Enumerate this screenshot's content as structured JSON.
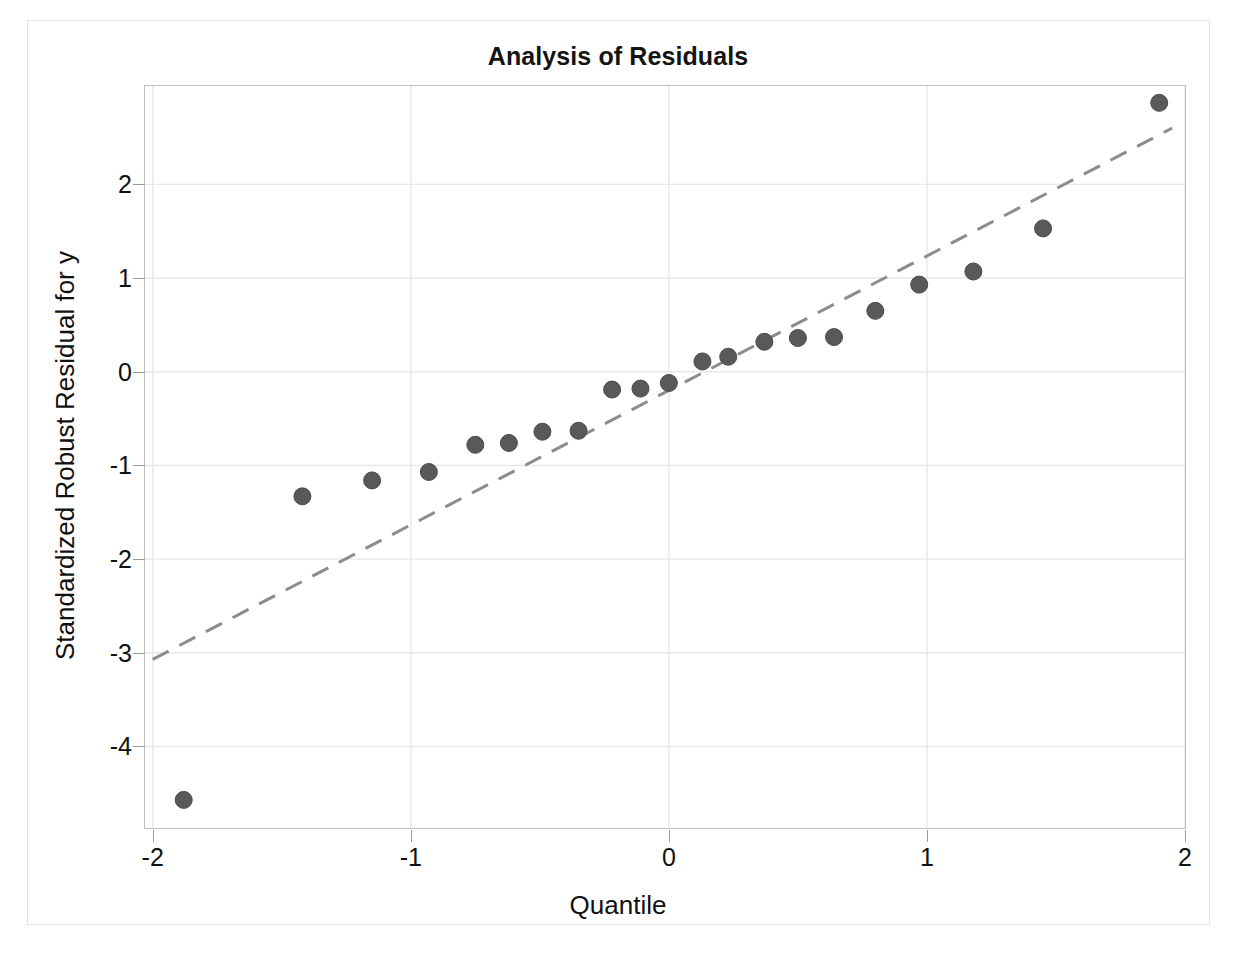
{
  "figure": {
    "title": "Analysis of Residuals",
    "background_color": "#ffffff",
    "frame_color": "#bfbfbf",
    "outer_border_color": "#e3e3e3"
  },
  "chart_data": {
    "type": "scatter",
    "title": "Analysis of Residuals",
    "xlabel": "Quantile",
    "ylabel": "Standardized Robust Residual for y",
    "xlim": [
      -2.03,
      2.0
    ],
    "ylim": [
      -4.87,
      3.05
    ],
    "xticks": [
      -2,
      -1,
      0,
      1,
      2
    ],
    "xtick_labels": [
      "-2",
      "-1",
      "0",
      "1",
      "2"
    ],
    "yticks": [
      2,
      1,
      0,
      -1,
      -2,
      -3,
      -4
    ],
    "ytick_labels": [
      "2",
      "1",
      "0",
      "-1",
      "-2",
      "-3",
      "-4"
    ],
    "grid": true,
    "grid_color": "#e8e8e8",
    "legend": null,
    "marker": {
      "shape": "circle",
      "fill_color": "#595959",
      "edge_color": "#4a4a4a",
      "size_px": 17
    },
    "series": [
      {
        "name": "Standardized robust residuals",
        "points": [
          {
            "x": -1.88,
            "y": -4.57
          },
          {
            "x": -1.42,
            "y": -1.33
          },
          {
            "x": -1.15,
            "y": -1.16
          },
          {
            "x": -0.93,
            "y": -1.07
          },
          {
            "x": -0.75,
            "y": -0.78
          },
          {
            "x": -0.62,
            "y": -0.76
          },
          {
            "x": -0.49,
            "y": -0.64
          },
          {
            "x": -0.35,
            "y": -0.63
          },
          {
            "x": -0.22,
            "y": -0.19
          },
          {
            "x": -0.11,
            "y": -0.18
          },
          {
            "x": 0.0,
            "y": -0.12
          },
          {
            "x": 0.13,
            "y": 0.11
          },
          {
            "x": 0.23,
            "y": 0.16
          },
          {
            "x": 0.37,
            "y": 0.32
          },
          {
            "x": 0.5,
            "y": 0.36
          },
          {
            "x": 0.64,
            "y": 0.37
          },
          {
            "x": 0.8,
            "y": 0.65
          },
          {
            "x": 0.97,
            "y": 0.93
          },
          {
            "x": 1.18,
            "y": 1.07
          },
          {
            "x": 1.45,
            "y": 1.53
          },
          {
            "x": 1.9,
            "y": 2.87
          }
        ]
      }
    ],
    "reference_line": {
      "name": "normal reference line",
      "style": "dashed",
      "color": "#8c8c8c",
      "dash_pattern": "18 12",
      "width_px": 3,
      "x_start": -2.0,
      "y_start": -3.07,
      "x_end": 1.95,
      "y_end": 2.6
    }
  }
}
